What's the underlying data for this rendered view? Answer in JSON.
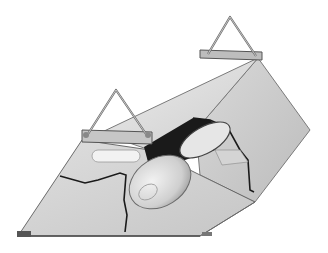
{
  "image": {
    "subject": "Lighting reflector hood with cutaway showing bulb",
    "style": "grayscale halftone product illustration",
    "parts": [
      {
        "name": "top-hanger-bracket"
      },
      {
        "name": "left-hanger-bracket"
      },
      {
        "name": "reflector-hood-body"
      },
      {
        "name": "cutaway-section"
      },
      {
        "name": "lamp-bulb"
      }
    ]
  },
  "colors": {
    "background": "#ffffff",
    "face_light": "#e4e4e4",
    "face_mid": "#cfcfcf",
    "face_dark": "#b4b4b4",
    "edge": "#5a5a5a",
    "cutaway": "#1a1a1a",
    "bulb": "#d8d8d8"
  }
}
